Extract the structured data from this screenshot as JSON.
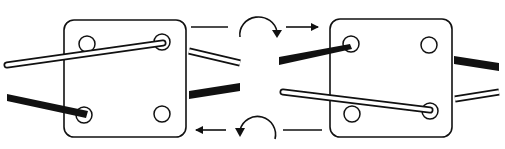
{
  "diagram": {
    "colors": {
      "ink": "#111111",
      "background": "#ffffff",
      "white_strand_fill": "#ffffff",
      "black_strand_fill": "#111111"
    },
    "cards": [
      {
        "id": "left-card",
        "x": 64,
        "y": 20,
        "w": 122,
        "h": 117,
        "holes": [
          [
            87,
            44
          ],
          [
            162,
            42
          ],
          [
            84,
            115
          ],
          [
            162,
            114
          ]
        ]
      },
      {
        "id": "right-card",
        "x": 330,
        "y": 19,
        "w": 122,
        "h": 118,
        "holes": [
          [
            351,
            44
          ],
          [
            429,
            45
          ],
          [
            352,
            114
          ],
          [
            430,
            111
          ]
        ]
      }
    ],
    "arrows": [
      {
        "id": "top-rotation",
        "direction": "clockwise"
      },
      {
        "id": "top-right-arrow",
        "direction": "right"
      },
      {
        "id": "bottom-rotation",
        "direction": "counterclockwise"
      },
      {
        "id": "bottom-left-arrow",
        "direction": "left"
      }
    ]
  }
}
